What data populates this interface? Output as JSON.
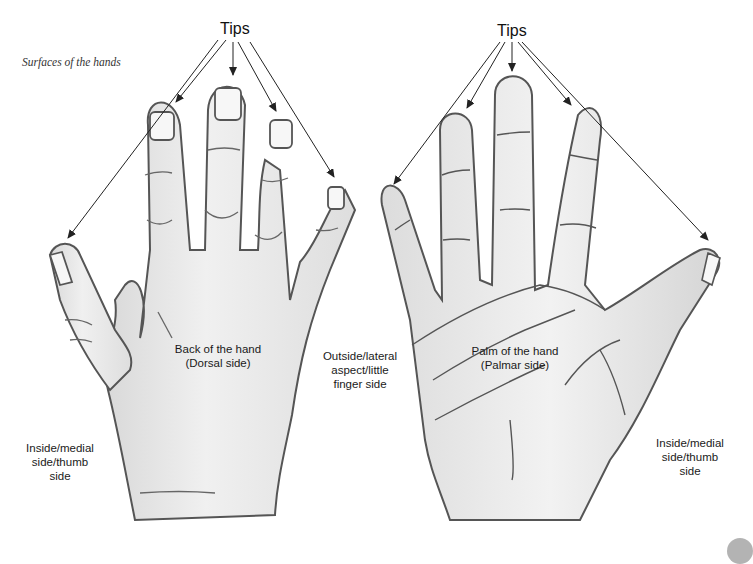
{
  "figure": {
    "caption": "Surfaces of the hands"
  },
  "left_hand": {
    "tips_label": "Tips",
    "center_label_line1": "Back of the hand",
    "center_label_line2": "(Dorsal side)",
    "thumb_side_label": [
      "Inside/medial",
      "side/thumb",
      "side"
    ]
  },
  "middle": {
    "lateral_label": [
      "Outside/lateral",
      "aspect/little",
      "finger side"
    ]
  },
  "right_hand": {
    "tips_label": "Tips",
    "center_label_line1": "Palm of the hand",
    "center_label_line2": "(Palmar side)",
    "thumb_side_label": [
      "Inside/medial",
      "side/thumb",
      "side"
    ]
  },
  "colors": {
    "outline": "#555555",
    "skin": "#ececec",
    "shade": "#cfcfcf",
    "arrow": "#222222"
  }
}
